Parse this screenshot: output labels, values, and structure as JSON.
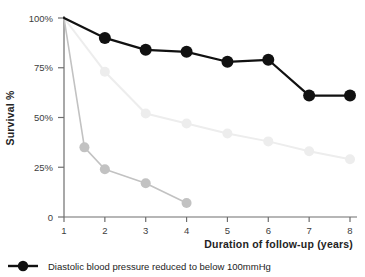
{
  "chart_data": {
    "type": "line",
    "title": "",
    "xlabel": "Duration of follow-up (years)",
    "ylabel": "Survival %",
    "xlim": [
      1,
      8
    ],
    "ylim": [
      0,
      100
    ],
    "xticks": [
      "1",
      "2",
      "3",
      "4",
      "5",
      "6",
      "7",
      "8"
    ],
    "xtick_values": [
      1,
      2,
      3,
      4,
      5,
      6,
      7,
      8
    ],
    "yticks": [
      "0",
      "25%",
      "50%",
      "75%",
      "100%"
    ],
    "ytick_values": [
      0,
      25,
      50,
      75,
      100
    ],
    "grid": false,
    "legend_position": "bottom-left",
    "series": [
      {
        "name": "Diastolic blood pressure reduced to below 100mmHg",
        "color": "#111111",
        "marker": "circle",
        "marker_size": 6,
        "line_width": 2.2,
        "x": [
          1,
          2,
          3,
          4,
          5,
          6,
          7,
          8
        ],
        "values": [
          100,
          90,
          84,
          83,
          78,
          79,
          61,
          61
        ]
      },
      {
        "name": "",
        "color": "#ededed",
        "marker": "circle",
        "marker_size": 5,
        "line_width": 2.0,
        "x": [
          1,
          2,
          3,
          4,
          5,
          6,
          7,
          8
        ],
        "values": [
          100,
          73,
          52,
          47,
          42,
          38,
          33,
          29
        ]
      },
      {
        "name": "",
        "color": "#c2c2c2",
        "marker": "circle",
        "marker_size": 5,
        "line_width": 1.6,
        "x": [
          1,
          1.5,
          2,
          3,
          4
        ],
        "values": [
          100,
          35,
          24,
          17,
          7
        ]
      }
    ]
  },
  "legend": {
    "entries": [
      {
        "label": "Diastolic blood pressure reduced to below 100mmHg",
        "color": "#111111"
      }
    ]
  },
  "axes": {
    "y_axis_label": "Survival %",
    "x_axis_label": "Duration of follow-up (years)"
  }
}
